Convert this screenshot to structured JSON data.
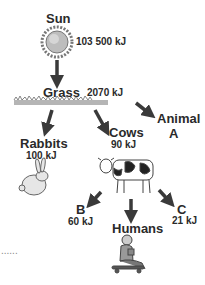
{
  "diagram": {
    "type": "food-web",
    "nodes": {
      "sun": {
        "label": "Sun",
        "energy": "103 500 kJ"
      },
      "grass": {
        "label": "Grass",
        "energy": "2070 kJ"
      },
      "rabbits": {
        "label": "Rabbits",
        "energy": "100 kJ"
      },
      "cows": {
        "label": "Cows",
        "energy": "90 kJ"
      },
      "animal_a": {
        "label_line1": "Animal",
        "label_line2": "A"
      },
      "b": {
        "label": "B",
        "energy": "60 kJ"
      },
      "c": {
        "label": "C",
        "energy": "21 kJ"
      },
      "humans": {
        "label": "Humans"
      }
    },
    "edges": [
      {
        "from": "Sun",
        "to": "Grass"
      },
      {
        "from": "Grass",
        "to": "Rabbits"
      },
      {
        "from": "Grass",
        "to": "Cows"
      },
      {
        "from": "Grass",
        "to": "Animal A"
      },
      {
        "from": "Cows",
        "to": "B"
      },
      {
        "from": "Cows",
        "to": "Humans"
      },
      {
        "from": "Cows",
        "to": "C"
      }
    ],
    "answer_blank": "......",
    "arrow_color": "#3a3a3a"
  }
}
